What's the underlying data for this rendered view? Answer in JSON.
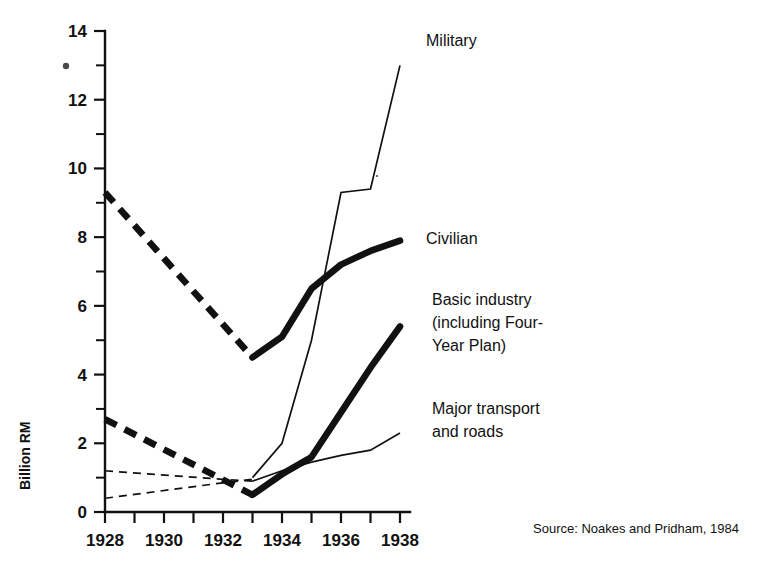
{
  "chart_data": {
    "type": "line",
    "title": "",
    "subtitle": "",
    "xlabel": "",
    "ylabel": "Billion RM",
    "xlim": [
      1928,
      1938
    ],
    "ylim": [
      0,
      14
    ],
    "grid": false,
    "legend_position": "right-inline-labels",
    "x_ticks": [
      1928,
      1929,
      1930,
      1931,
      1932,
      1933,
      1934,
      1935,
      1936,
      1937,
      1938
    ],
    "x_tick_labels": [
      "1928",
      "",
      "1930",
      "",
      "1932",
      "",
      "1934",
      "",
      "1936",
      "",
      "1938"
    ],
    "x_tick_labels_shown": [
      "1928",
      "1930",
      "1932",
      "1934",
      "1936",
      "1938"
    ],
    "y_ticks": [
      0,
      1,
      2,
      3,
      4,
      5,
      6,
      7,
      8,
      9,
      10,
      11,
      12,
      13,
      14
    ],
    "y_tick_labels_shown": [
      "0",
      "2",
      "4",
      "6",
      "8",
      "10",
      "12",
      "14"
    ],
    "units": "Billion RM",
    "series": [
      {
        "name": "Military",
        "label": "Military",
        "style": "thin",
        "x": [
          1928,
          1933,
          1934,
          1935,
          1936,
          1937,
          1938
        ],
        "values": [
          null,
          1.0,
          2.0,
          5.0,
          9.3,
          9.4,
          13.0
        ],
        "dashed_segment_x": [],
        "dashed_segment_values": [],
        "solid_from": 1933,
        "label_x": 1938,
        "label_y": 13.0
      },
      {
        "name": "Civilian",
        "label": "Civilian",
        "style": "thick",
        "x": [
          1928,
          1933,
          1934,
          1935,
          1936,
          1937,
          1938
        ],
        "values": [
          9.3,
          4.5,
          5.1,
          6.5,
          7.2,
          7.6,
          7.9
        ],
        "dashed_segment_x": [
          1928,
          1933
        ],
        "dashed_segment_values": [
          9.3,
          4.5
        ],
        "solid_from": 1933,
        "label_x": 1938,
        "label_y": 7.9
      },
      {
        "name": "Basic industry (including Four-Year Plan)",
        "label_lines": [
          "Basic industry",
          "(including Four-",
          "Year Plan)"
        ],
        "style": "thick",
        "x": [
          1928,
          1933,
          1934,
          1935,
          1936,
          1937,
          1938
        ],
        "values": [
          2.7,
          0.5,
          1.1,
          1.6,
          2.9,
          4.2,
          5.4
        ],
        "dashed_segment_x": [
          1928,
          1933
        ],
        "dashed_segment_values": [
          2.7,
          0.5
        ],
        "solid_from": 1933,
        "label_x": 1938,
        "label_y": 5.4
      },
      {
        "name": "Major transport and roads",
        "label_lines": [
          "Major transport",
          "and roads"
        ],
        "style": "thin",
        "x": [
          1928,
          1932,
          1933,
          1934,
          1935,
          1936,
          1937,
          1938
        ],
        "values": [
          1.2,
          0.95,
          0.9,
          1.2,
          1.45,
          1.65,
          1.8,
          2.3
        ],
        "dashed_segment_x": [
          1928,
          1932,
          1933
        ],
        "dashed_segment_values": [
          1.2,
          0.95,
          0.9
        ],
        "solid_from": 1933,
        "label_x": 1938,
        "label_y": 2.3
      },
      {
        "name": "Lower estimate trace",
        "label": "",
        "style": "thin-dashed-only",
        "x": [
          1928,
          1932,
          1933
        ],
        "values": [
          0.4,
          0.85,
          0.95
        ],
        "dashed_segment_x": [
          1928,
          1932,
          1933
        ],
        "dashed_segment_values": [
          0.4,
          0.85,
          0.95
        ],
        "solid_from": null,
        "label_x": null,
        "label_y": null
      }
    ]
  },
  "axis": {
    "y_title": "Billion RM",
    "y_labels": [
      {
        "value": 14,
        "text": "14"
      },
      {
        "value": 12,
        "text": "12"
      },
      {
        "value": 10,
        "text": "10"
      },
      {
        "value": 8,
        "text": "8"
      },
      {
        "value": 6,
        "text": "6"
      },
      {
        "value": 4,
        "text": "4"
      },
      {
        "value": 2,
        "text": "2"
      },
      {
        "value": 0,
        "text": "0"
      }
    ],
    "x_labels": [
      {
        "value": 1928,
        "text": "1928"
      },
      {
        "value": 1930,
        "text": "1930"
      },
      {
        "value": 1932,
        "text": "1932"
      },
      {
        "value": 1934,
        "text": "1934"
      },
      {
        "value": 1936,
        "text": "1936"
      },
      {
        "value": 1938,
        "text": "1938"
      }
    ]
  },
  "annotations": {
    "military_label": "Military",
    "civilian_label": "Civilian",
    "basic_industry_line1": "Basic industry",
    "basic_industry_line2": "(including Four-",
    "basic_industry_line3": "Year Plan)",
    "transport_line1": "Major transport",
    "transport_line2": "and roads"
  },
  "source": {
    "text": "Source: Noakes and Pridham, 1984"
  },
  "colors": {
    "ink": "#111111",
    "background": "#ffffff",
    "stray_mark": "#4a4a4a"
  }
}
